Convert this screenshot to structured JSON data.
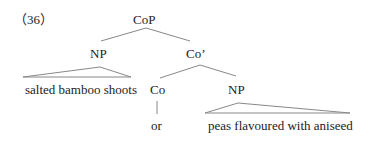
{
  "example_number": "（36）",
  "tree": {
    "root": "CoP",
    "left_np": "NP",
    "co_bar": "Co’",
    "co": "Co",
    "right_np": "NP",
    "left_phrase": "salted bamboo shoots",
    "conjunction": "or",
    "right_phrase": "peas flavoured with aniseed"
  }
}
